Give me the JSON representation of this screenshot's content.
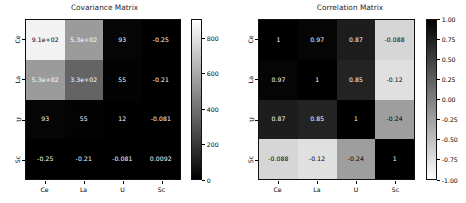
{
  "figure": {
    "background": "#ffffff",
    "text_color": "#000000",
    "label_color": "#262626"
  },
  "panels": [
    {
      "id": "covariance",
      "title": "Covariance Matrix",
      "xticklabels": [
        "Ce",
        "La",
        "U",
        "Sc"
      ],
      "yticklabels": [
        "Ce",
        "La",
        "U",
        "Sc"
      ],
      "colorbar": {
        "ticks": [
          "800",
          "600",
          "400",
          "200",
          "0"
        ],
        "tick_values": [
          800,
          600,
          400,
          200,
          0
        ],
        "vmin": 0,
        "vmax": 910,
        "orientation": "vertical",
        "colormap": "gray"
      },
      "celltext": [
        [
          "9.1e+02",
          "5.3e+02",
          "93",
          "-0.25"
        ],
        [
          "5.3e+02",
          "3.3e+02",
          "55",
          "-0.21"
        ],
        [
          "93",
          "55",
          "12",
          "-0.081"
        ],
        [
          "-0.25",
          "-0.21",
          "-0.081",
          "0.0092"
        ]
      ],
      "cellcolors": [
        [
          "#f2f2f2",
          "#9b9b9b",
          "#050505",
          "#000000"
        ],
        [
          "#9b9b9b",
          "#646464",
          "#030303",
          "#000000"
        ],
        [
          "#050505",
          "#030303",
          "#010101",
          "#000000"
        ],
        [
          "#000000",
          "#000000",
          "#000000",
          "#000000"
        ]
      ],
      "textcolors": [
        [
          "#000000",
          "#ffffff",
          "#ffffff",
          "#ffffff"
        ],
        [
          "#ffffff",
          "#ffffff",
          "#ffffff",
          "#ffffff"
        ],
        [
          "#ffffff",
          "#ffffff",
          "#ffffff",
          "#ffffff"
        ],
        [
          "#ffffff",
          "#ffffff",
          "#ffffff",
          "#ffffff"
        ]
      ]
    },
    {
      "id": "correlation",
      "title": "Correlation Matrix",
      "xticklabels": [
        "Ce",
        "La",
        "U",
        "Sc"
      ],
      "yticklabels": [
        "Ce",
        "La",
        "U",
        "Sc"
      ],
      "colorbar": {
        "ticks": [
          "1.00",
          "0.75",
          "0.50",
          "0.25",
          "0.00",
          "-0.25",
          "-0.50",
          "-0.75",
          "-1.00"
        ],
        "tick_values": [
          1.0,
          0.75,
          0.5,
          0.25,
          0.0,
          -0.25,
          -0.5,
          -0.75,
          -1.0
        ],
        "vmin": -1.0,
        "vmax": 1.0,
        "orientation": "vertical",
        "colormap": "gray_r"
      },
      "celltext": [
        [
          "1",
          "0.97",
          "0.87",
          "-0.088"
        ],
        [
          "0.97",
          "1",
          "0.85",
          "-0.12"
        ],
        [
          "0.87",
          "0.85",
          "1",
          "-0.24"
        ],
        [
          "-0.088",
          "-0.12",
          "-0.24",
          "1"
        ]
      ],
      "cellcolors": [
        [
          "#000000",
          "#050505",
          "#1d1d1d",
          "#d6d6d6"
        ],
        [
          "#050505",
          "#000000",
          "#232323",
          "#e0e0e0"
        ],
        [
          "#1d1d1d",
          "#232323",
          "#000000",
          "#9e9e9e"
        ],
        [
          "#d6d6d6",
          "#e0e0e0",
          "#9e9e9e",
          "#000000"
        ]
      ],
      "textcolors": [
        [
          "#ffffff",
          "#ffffff",
          "#ffffff",
          "#000000"
        ],
        [
          "#ffffff",
          "#ffffff",
          "#ffffff",
          "#000000"
        ],
        [
          "#ffffff",
          "#ffffff",
          "#ffffff",
          "#000000"
        ],
        [
          "#000000",
          "#000000",
          "#000000",
          "#ffffff"
        ]
      ]
    }
  ],
  "chart_data": [
    {
      "type": "heatmap",
      "title": "Covariance Matrix",
      "xlabel": "",
      "ylabel": "",
      "categories_x": [
        "Ce",
        "La",
        "U",
        "Sc"
      ],
      "categories_y": [
        "Ce",
        "La",
        "U",
        "Sc"
      ],
      "values": [
        [
          910,
          530,
          93,
          -0.25
        ],
        [
          530,
          330,
          55,
          -0.21
        ],
        [
          93,
          55,
          12,
          -0.081
        ],
        [
          -0.25,
          -0.21,
          -0.081,
          0.0092
        ]
      ],
      "annotations": [
        [
          "9.1e+02",
          "5.3e+02",
          "93",
          "-0.25"
        ],
        [
          "5.3e+02",
          "3.3e+02",
          "55",
          "-0.21"
        ],
        [
          "93",
          "55",
          "12",
          "-0.081"
        ],
        [
          "-0.25",
          "-0.21",
          "-0.081",
          "0.0092"
        ]
      ],
      "colorbar_ticks": [
        0,
        200,
        400,
        600,
        800
      ],
      "clim": [
        0,
        910
      ],
      "colormap": "gray",
      "grid": false,
      "legend": "colorbar-right"
    },
    {
      "type": "heatmap",
      "title": "Correlation Matrix",
      "xlabel": "",
      "ylabel": "",
      "categories_x": [
        "Ce",
        "La",
        "U",
        "Sc"
      ],
      "categories_y": [
        "Ce",
        "La",
        "U",
        "Sc"
      ],
      "values": [
        [
          1,
          0.97,
          0.87,
          -0.088
        ],
        [
          0.97,
          1,
          0.85,
          -0.12
        ],
        [
          0.87,
          0.85,
          1,
          -0.24
        ],
        [
          -0.088,
          -0.12,
          -0.24,
          1
        ]
      ],
      "annotations": [
        [
          "1",
          "0.97",
          "0.87",
          "-0.088"
        ],
        [
          "0.97",
          "1",
          "0.85",
          "-0.12"
        ],
        [
          "0.87",
          "0.85",
          "1",
          "-0.24"
        ],
        [
          "-0.088",
          "-0.12",
          "-0.24",
          "1"
        ]
      ],
      "colorbar_ticks": [
        1.0,
        0.75,
        0.5,
        0.25,
        0.0,
        -0.25,
        -0.5,
        -0.75,
        -1.0
      ],
      "clim": [
        -1.0,
        1.0
      ],
      "colormap": "gray_r",
      "grid": false,
      "legend": "colorbar-right"
    }
  ]
}
